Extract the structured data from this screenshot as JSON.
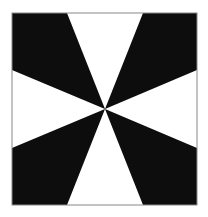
{
  "figure": {
    "frame": {
      "x": 12,
      "y": 13,
      "width": 185,
      "height": 192,
      "stroke": "#888888"
    },
    "center": {
      "x": 105,
      "y": 109
    },
    "colors": {
      "dark": "#0d0d0d",
      "light": "#ffffff"
    },
    "edge_points": {
      "top_left_x": 67,
      "top_right_x": 143,
      "bottom_left_x": 67,
      "bottom_right_x": 143,
      "left_upper_y": 70,
      "left_lower_y": 148,
      "right_upper_y": 70,
      "right_lower_y": 148
    }
  }
}
